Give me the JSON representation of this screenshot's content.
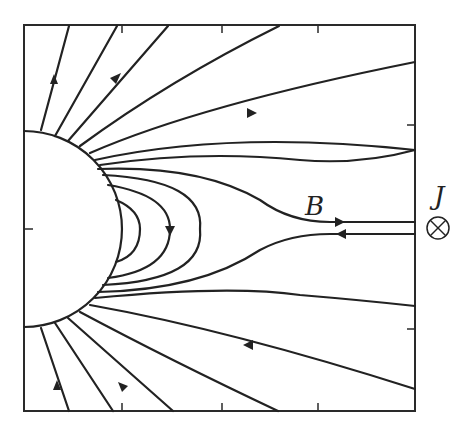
{
  "figure": {
    "labels": {
      "field": "B",
      "current": "J",
      "current_symbol": "⊗"
    },
    "colors": {
      "line": "#222222",
      "background": "#ffffff"
    },
    "frame": {
      "left": 24,
      "top": 25,
      "right": 415,
      "bottom": 411
    },
    "ticks": {
      "top_x": [
        122,
        222,
        318
      ],
      "bottom_x": [
        122,
        222,
        318
      ],
      "left_y": [
        229
      ],
      "right_y": [
        125,
        329
      ]
    },
    "body": {
      "shape": "half-circle",
      "cx": 24,
      "cy": 229,
      "r": 98
    }
  }
}
